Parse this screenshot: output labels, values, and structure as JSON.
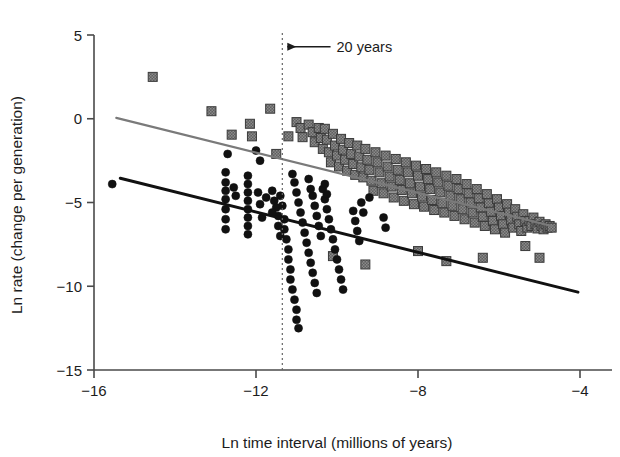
{
  "chart_data": {
    "type": "scatter",
    "title": "",
    "xlabel": "Ln time interval (millions of years)",
    "ylabel": "Ln rate (change per generation)",
    "xlim": [
      -16,
      -4
    ],
    "ylim": [
      -15,
      5
    ],
    "xticks": [
      -16,
      -12,
      -8,
      -4
    ],
    "xtick_labels": [
      "−16",
      "−12",
      "−8",
      "−4"
    ],
    "yticks": [
      5,
      0,
      -5,
      -10,
      -15
    ],
    "ytick_labels": [
      "5",
      "0",
      "−5",
      "−10",
      "−15"
    ],
    "grid": false,
    "legend": "none",
    "annotations": [
      {
        "name": "twenty-years-annotation",
        "text": "20 years",
        "x": -10.9,
        "y": 4.3,
        "arrow_to_x": -11.35,
        "arrow_style": "left-arrow",
        "vline_at_x": -11.35,
        "vline_style": "dotted"
      }
    ],
    "series": [
      {
        "name": "Squares (gray, fossil/long-interval rates)",
        "marker": "square",
        "color": "#6d6d6d",
        "edge_color": "#3a3a3a",
        "marker_size": 9,
        "points": [
          [
            -14.55,
            2.5
          ],
          [
            -13.1,
            0.45
          ],
          [
            -12.15,
            -0.3
          ],
          [
            -11.65,
            0.6
          ],
          [
            -12.1,
            -1.05
          ],
          [
            -11.2,
            -1.05
          ],
          [
            -12.6,
            -0.95
          ],
          [
            -11.5,
            -2.1
          ],
          [
            -11.0,
            -0.2
          ],
          [
            -10.9,
            -0.55
          ],
          [
            -10.85,
            -1.1
          ],
          [
            -10.7,
            -0.35
          ],
          [
            -10.6,
            -0.8
          ],
          [
            -10.55,
            -1.4
          ],
          [
            -10.45,
            -0.55
          ],
          [
            -10.4,
            -1.15
          ],
          [
            -10.35,
            -1.8
          ],
          [
            -10.3,
            -0.6
          ],
          [
            -10.25,
            -1.25
          ],
          [
            -10.2,
            -2.0
          ],
          [
            -10.15,
            -2.6
          ],
          [
            -10.1,
            -0.9
          ],
          [
            -10.05,
            -1.6
          ],
          [
            -10.0,
            -2.2
          ],
          [
            -9.95,
            -2.85
          ],
          [
            -9.9,
            -1.2
          ],
          [
            -9.85,
            -1.85
          ],
          [
            -9.8,
            -2.45
          ],
          [
            -9.75,
            -3.1
          ],
          [
            -9.7,
            -1.45
          ],
          [
            -9.65,
            -2.1
          ],
          [
            -9.6,
            -2.7
          ],
          [
            -9.55,
            -3.35
          ],
          [
            -9.5,
            -1.6
          ],
          [
            -9.45,
            -2.25
          ],
          [
            -9.4,
            -2.9
          ],
          [
            -9.35,
            -3.5
          ],
          [
            -9.3,
            -1.8
          ],
          [
            -9.25,
            -2.45
          ],
          [
            -9.2,
            -3.05
          ],
          [
            -9.15,
            -3.7
          ],
          [
            -9.1,
            -4.3
          ],
          [
            -9.05,
            -2.0
          ],
          [
            -9.0,
            -2.6
          ],
          [
            -8.95,
            -3.2
          ],
          [
            -8.9,
            -3.85
          ],
          [
            -8.85,
            -4.45
          ],
          [
            -8.8,
            -2.2
          ],
          [
            -8.75,
            -2.85
          ],
          [
            -8.7,
            -3.45
          ],
          [
            -8.65,
            -4.05
          ],
          [
            -8.6,
            -4.7
          ],
          [
            -8.55,
            -2.4
          ],
          [
            -8.5,
            -3.05
          ],
          [
            -8.45,
            -3.65
          ],
          [
            -8.4,
            -4.25
          ],
          [
            -8.35,
            -4.9
          ],
          [
            -8.3,
            -2.6
          ],
          [
            -8.25,
            -3.2
          ],
          [
            -8.2,
            -3.85
          ],
          [
            -8.15,
            -4.45
          ],
          [
            -8.1,
            -5.1
          ],
          [
            -8.05,
            -2.8
          ],
          [
            -8.0,
            -3.4
          ],
          [
            -7.95,
            -4.05
          ],
          [
            -7.9,
            -4.65
          ],
          [
            -7.85,
            -5.25
          ],
          [
            -7.8,
            -3.0
          ],
          [
            -7.75,
            -3.6
          ],
          [
            -7.7,
            -4.2
          ],
          [
            -7.65,
            -4.85
          ],
          [
            -7.6,
            -5.45
          ],
          [
            -7.55,
            -3.2
          ],
          [
            -7.5,
            -3.8
          ],
          [
            -7.45,
            -4.4
          ],
          [
            -7.4,
            -5.05
          ],
          [
            -7.35,
            -5.6
          ],
          [
            -7.3,
            -3.4
          ],
          [
            -7.25,
            -4.0
          ],
          [
            -7.2,
            -4.6
          ],
          [
            -7.15,
            -5.2
          ],
          [
            -7.1,
            -5.8
          ],
          [
            -7.05,
            -3.6
          ],
          [
            -7.0,
            -4.2
          ],
          [
            -6.95,
            -4.8
          ],
          [
            -6.9,
            -5.4
          ],
          [
            -6.85,
            -6.0
          ],
          [
            -6.8,
            -3.9
          ],
          [
            -6.75,
            -4.45
          ],
          [
            -6.7,
            -5.0
          ],
          [
            -6.65,
            -5.6
          ],
          [
            -6.6,
            -6.2
          ],
          [
            -6.55,
            -4.2
          ],
          [
            -6.5,
            -4.75
          ],
          [
            -6.45,
            -5.3
          ],
          [
            -6.4,
            -5.85
          ],
          [
            -6.35,
            -6.4
          ],
          [
            -6.3,
            -4.5
          ],
          [
            -6.25,
            -5.05
          ],
          [
            -6.2,
            -5.55
          ],
          [
            -6.15,
            -6.1
          ],
          [
            -6.1,
            -6.6
          ],
          [
            -6.05,
            -4.8
          ],
          [
            -6.0,
            -5.3
          ],
          [
            -5.95,
            -5.8
          ],
          [
            -5.9,
            -6.3
          ],
          [
            -5.85,
            -6.8
          ],
          [
            -5.8,
            -5.1
          ],
          [
            -5.75,
            -5.6
          ],
          [
            -5.7,
            -6.05
          ],
          [
            -5.65,
            -6.5
          ],
          [
            -5.6,
            -5.4
          ],
          [
            -5.55,
            -5.85
          ],
          [
            -5.5,
            -6.3
          ],
          [
            -5.45,
            -6.7
          ],
          [
            -5.4,
            -5.7
          ],
          [
            -5.35,
            -6.1
          ],
          [
            -5.3,
            -6.5
          ],
          [
            -5.25,
            -6.1
          ],
          [
            -5.2,
            -6.4
          ],
          [
            -5.15,
            -5.9
          ],
          [
            -5.1,
            -6.3
          ],
          [
            -5.05,
            -6.55
          ],
          [
            -5.0,
            -6.15
          ],
          [
            -4.95,
            -6.4
          ],
          [
            -4.9,
            -6.6
          ],
          [
            -4.85,
            -6.3
          ],
          [
            -4.8,
            -6.5
          ],
          [
            -4.75,
            -6.4
          ],
          [
            -4.7,
            -6.5
          ],
          [
            -8.0,
            -7.9
          ],
          [
            -7.3,
            -8.5
          ],
          [
            -6.4,
            -8.3
          ],
          [
            -5.35,
            -7.6
          ],
          [
            -5.0,
            -8.3
          ],
          [
            -9.3,
            -8.7
          ],
          [
            -10.1,
            -8.2
          ]
        ]
      },
      {
        "name": "Circles (black, laboratory/short-interval rates)",
        "marker": "circle",
        "color": "#111111",
        "edge_color": "#111111",
        "marker_size": 8,
        "points": [
          [
            -15.55,
            -3.9
          ],
          [
            -12.7,
            -2.1
          ],
          [
            -12.75,
            -3.2
          ],
          [
            -12.75,
            -3.8
          ],
          [
            -12.75,
            -4.3
          ],
          [
            -12.75,
            -4.8
          ],
          [
            -12.75,
            -5.4
          ],
          [
            -12.75,
            -6.0
          ],
          [
            -12.75,
            -6.6
          ],
          [
            -12.2,
            -3.4
          ],
          [
            -12.2,
            -3.9
          ],
          [
            -12.2,
            -4.4
          ],
          [
            -12.2,
            -4.9
          ],
          [
            -12.2,
            -5.4
          ],
          [
            -12.2,
            -5.9
          ],
          [
            -12.2,
            -6.4
          ],
          [
            -12.2,
            -6.9
          ],
          [
            -11.95,
            -4.4
          ],
          [
            -11.9,
            -5.1
          ],
          [
            -11.85,
            -5.9
          ],
          [
            -11.6,
            -4.3
          ],
          [
            -11.55,
            -4.9
          ],
          [
            -11.5,
            -5.3
          ],
          [
            -11.45,
            -5.8
          ],
          [
            -11.75,
            -4.7
          ],
          [
            -11.4,
            -4.6
          ],
          [
            -11.35,
            -5.2
          ],
          [
            -11.3,
            -6.0
          ],
          [
            -11.3,
            -6.6
          ],
          [
            -11.25,
            -7.2
          ],
          [
            -11.2,
            -7.8
          ],
          [
            -11.2,
            -8.4
          ],
          [
            -11.15,
            -9.0
          ],
          [
            -11.15,
            -9.6
          ],
          [
            -11.1,
            -10.2
          ],
          [
            -11.05,
            -10.8
          ],
          [
            -11.0,
            -11.4
          ],
          [
            -11.0,
            -12.0
          ],
          [
            -10.95,
            -12.5
          ],
          [
            -11.4,
            -7.0
          ],
          [
            -11.45,
            -6.4
          ],
          [
            -11.6,
            -5.6
          ],
          [
            -11.0,
            -4.4
          ],
          [
            -10.95,
            -5.0
          ],
          [
            -10.9,
            -5.6
          ],
          [
            -10.85,
            -6.2
          ],
          [
            -10.8,
            -6.8
          ],
          [
            -10.75,
            -7.4
          ],
          [
            -10.7,
            -8.0
          ],
          [
            -10.65,
            -8.6
          ],
          [
            -10.6,
            -9.2
          ],
          [
            -10.55,
            -9.8
          ],
          [
            -10.5,
            -10.4
          ],
          [
            -10.6,
            -4.6
          ],
          [
            -10.55,
            -5.2
          ],
          [
            -10.5,
            -5.8
          ],
          [
            -10.45,
            -6.4
          ],
          [
            -10.4,
            -7.0
          ],
          [
            -10.35,
            -4.2
          ],
          [
            -10.3,
            -4.8
          ],
          [
            -10.25,
            -5.4
          ],
          [
            -10.2,
            -6.0
          ],
          [
            -10.15,
            -6.6
          ],
          [
            -10.1,
            -7.2
          ],
          [
            -10.05,
            -7.8
          ],
          [
            -10.0,
            -8.4
          ],
          [
            -9.95,
            -9.0
          ],
          [
            -9.9,
            -9.6
          ],
          [
            -9.85,
            -10.2
          ],
          [
            -10.3,
            -3.9
          ],
          [
            -10.25,
            -4.5
          ],
          [
            -10.7,
            -3.6
          ],
          [
            -10.65,
            -4.2
          ],
          [
            -11.9,
            -2.5
          ],
          [
            -12.0,
            -1.9
          ],
          [
            -11.05,
            -3.8
          ],
          [
            -11.1,
            -3.3
          ],
          [
            -9.6,
            -5.5
          ],
          [
            -9.55,
            -6.1
          ],
          [
            -9.5,
            -6.7
          ],
          [
            -9.45,
            -7.3
          ],
          [
            -9.4,
            -5.0
          ],
          [
            -9.35,
            -5.6
          ],
          [
            -8.85,
            -5.9
          ],
          [
            -8.8,
            -6.5
          ],
          [
            -9.2,
            -4.7
          ],
          [
            -12.55,
            -4.1
          ],
          [
            -12.5,
            -4.6
          ]
        ]
      }
    ],
    "trend_lines": [
      {
        "name": "gray-regression-line",
        "color": "#7a7a7a",
        "width": 2.2,
        "x_start": -15.45,
        "y_start": 0.05,
        "x_end": -4.7,
        "y_end": -6.4
      },
      {
        "name": "black-regression-line",
        "color": "#111111",
        "width": 3,
        "x_start": -15.35,
        "y_start": -3.55,
        "x_end": -4.05,
        "y_end": -10.35
      }
    ]
  }
}
